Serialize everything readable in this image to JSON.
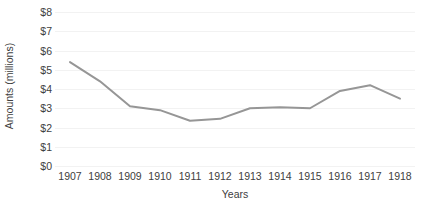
{
  "chart_data": {
    "type": "line",
    "title": "",
    "xlabel": "Years",
    "ylabel": "Amounts (millions)",
    "categories": [
      "1907",
      "1908",
      "1909",
      "1910",
      "1911",
      "1912",
      "1913",
      "1914",
      "1915",
      "1916",
      "1917",
      "1918"
    ],
    "values": [
      5.4,
      4.4,
      3.1,
      2.9,
      2.35,
      2.45,
      3.0,
      3.05,
      3.0,
      3.9,
      4.2,
      3.5
    ],
    "series": [
      {
        "name": "Amounts",
        "values": [
          5.4,
          4.4,
          3.1,
          2.9,
          2.35,
          2.45,
          3.0,
          3.05,
          3.0,
          3.9,
          4.2,
          3.5
        ],
        "color": "#969696"
      }
    ],
    "ylim": [
      0,
      8
    ],
    "ytick_step": 1,
    "ytick_labels": [
      "$0",
      "$1",
      "$2",
      "$3",
      "$4",
      "$5",
      "$6",
      "$7",
      "$8"
    ],
    "grid": true,
    "grid_orientation": "horizontal",
    "grid_color": "#f2f2f2",
    "legend": false,
    "markers": false,
    "line_width": 2,
    "line_color": "#969696",
    "background": "#ffffff",
    "text_color": "#404040"
  }
}
